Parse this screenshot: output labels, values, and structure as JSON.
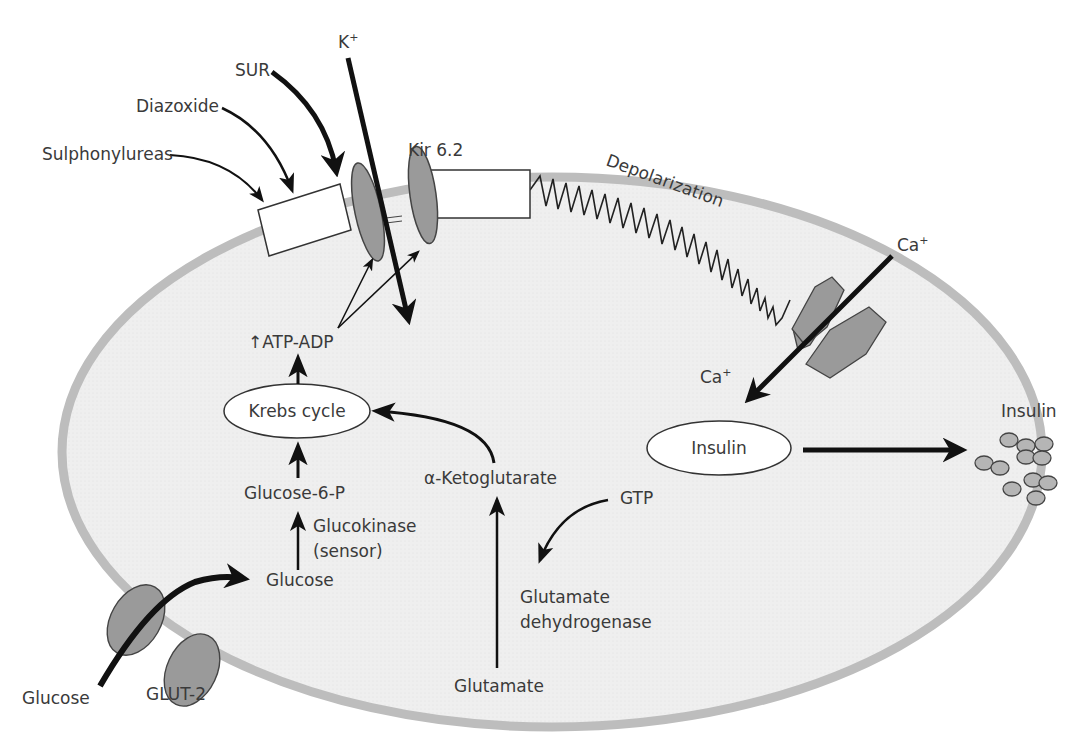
{
  "colors": {
    "cell_fill": "#ececec",
    "membrane": "#bdbdbd",
    "protein_fill": "#9a9a9a",
    "protein_stroke": "#444444",
    "arrow": "#111111",
    "text": "#3a3a3a",
    "box_fill": "#ffffff"
  },
  "labels": {
    "sur": "SUR",
    "k_plus": "K",
    "k_plus_sup": "+",
    "diazoxide": "Diazoxide",
    "sulphonylureas": "Sulphonylureas",
    "kir": "Kir 6.2",
    "depolarization": "Depolarization",
    "ca_outside": "Ca",
    "ca_outside_sup": "+",
    "ca_inside": "Ca",
    "ca_inside_sup": "+",
    "atp_adp": "ATP-ADP",
    "atp_adp_prefix": "↑",
    "krebs": "Krebs cycle",
    "insulin_vesicle": "Insulin",
    "insulin_secreted": "Insulin",
    "glucose_6_p": "Glucose-6-P",
    "glucokinase": "Glucokinase",
    "glucokinase_sub": "(sensor)",
    "glucose_inside": "Glucose",
    "alpha_kg": "α-Ketoglutarate",
    "gtp": "GTP",
    "gdh_line1": "Glutamate",
    "gdh_line2": "dehydrogenase",
    "glutamate": "Glutamate",
    "glucose_outside": "Glucose",
    "glut2": "GLUT-2"
  }
}
